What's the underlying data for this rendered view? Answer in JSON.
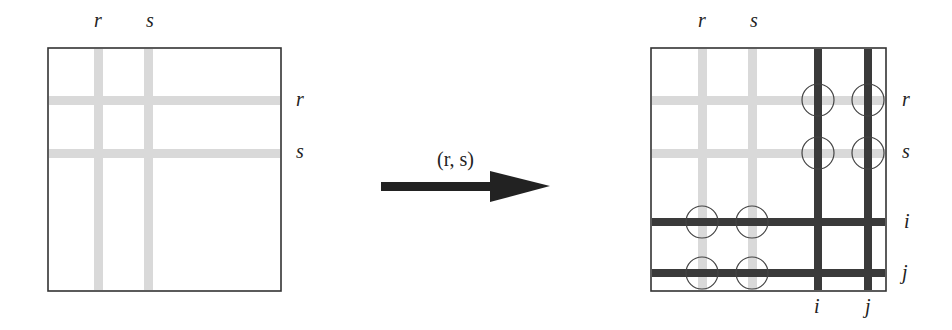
{
  "left_matrix": {
    "col_labels": [
      "r",
      "s"
    ],
    "row_labels": [
      "r",
      "s"
    ],
    "light_line_color": "#d9d9d9",
    "border_color": "#333333"
  },
  "transform_arrow": {
    "label": "(r, s)",
    "color": "#222222"
  },
  "right_matrix": {
    "top_col_labels": [
      "r",
      "s"
    ],
    "right_row_labels": [
      "r",
      "s",
      "i",
      "j"
    ],
    "bottom_col_labels": [
      "i",
      "j"
    ],
    "light_line_color": "#d9d9d9",
    "dark_line_color": "#3a3a3a",
    "circle_count": 8
  }
}
